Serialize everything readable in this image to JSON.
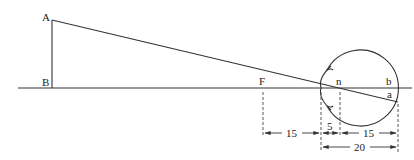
{
  "diagram": {
    "type": "reduced-eye optics diagram",
    "points": {
      "A": {
        "label": "A"
      },
      "B": {
        "label": "B"
      },
      "F": {
        "label": "F"
      },
      "n": {
        "label": "n"
      },
      "b": {
        "label": "b"
      },
      "a": {
        "label": "a"
      }
    },
    "dimensions": [
      {
        "id": "F-to-cornea",
        "label": "15"
      },
      {
        "id": "cornea-to-n",
        "label": "5"
      },
      {
        "id": "n-to-retina",
        "label": "15"
      },
      {
        "id": "cornea-to-retina",
        "label": "20"
      }
    ],
    "colors": {
      "line": "#333333",
      "background": "#ffffff"
    }
  }
}
